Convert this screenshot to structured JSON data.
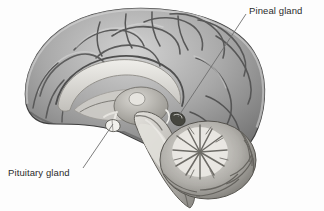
{
  "figure": {
    "name": "mid-sagittal-brain-section",
    "background_color": "#fdfdfd",
    "width": 324,
    "height": 211
  },
  "palette": {
    "background": "#fdfdfd",
    "outline": "#3b3b3b",
    "cortex_light": "#c6c6c6",
    "cortex_mid": "#9d9d9d",
    "cortex_dark": "#6a6a6a",
    "cortex_shadow": "#4e4e4e",
    "white_matter": "#e3e2de",
    "white_matter_edge": "#b2b0ab",
    "brainstem_light": "#d6d4cf",
    "brainstem_mid": "#a9a7a2",
    "cerebellum_light": "#dedcd7",
    "cerebellum_dark": "#7b7974",
    "gland_highlight": "#efeeea",
    "gland_dark": "#4a4a4a",
    "label_text": "#2b2b2b",
    "leader_line": "#6e6e6e"
  },
  "annotations": [
    {
      "id": "pineal",
      "label": "Pineal gland",
      "text_x": 249,
      "text_y": 5,
      "leader_start_x": 246,
      "leader_start_y": 14,
      "leader_end_x": 178,
      "leader_end_y": 117,
      "target_structure": "pineal gland"
    },
    {
      "id": "pituitary",
      "label": "Pituitary gland",
      "text_x": 8,
      "text_y": 167,
      "leader_start_x": 83,
      "leader_start_y": 168,
      "leader_end_x": 113,
      "leader_end_y": 124,
      "target_structure": "pituitary gland"
    }
  ],
  "structures": [
    {
      "id": "cerebral-cortex",
      "name": "cerebral cortex"
    },
    {
      "id": "corpus-callosum",
      "name": "corpus callosum"
    },
    {
      "id": "thalamus",
      "name": "thalamus"
    },
    {
      "id": "pineal-gland",
      "name": "pineal gland"
    },
    {
      "id": "pituitary-gland",
      "name": "pituitary gland"
    },
    {
      "id": "midbrain",
      "name": "midbrain"
    },
    {
      "id": "pons",
      "name": "pons"
    },
    {
      "id": "medulla",
      "name": "medulla oblongata"
    },
    {
      "id": "cerebellum",
      "name": "cerebellum"
    },
    {
      "id": "arbor-vitae",
      "name": "arbor vitae"
    }
  ]
}
